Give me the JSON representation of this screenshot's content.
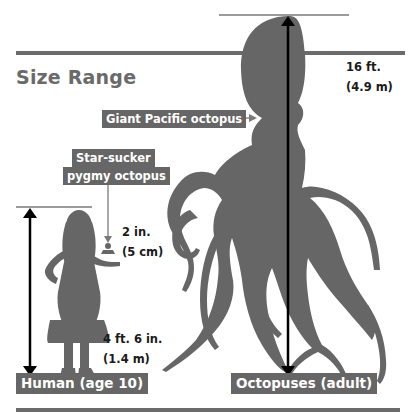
{
  "title": "Size Range",
  "colors": {
    "silhouette": "#666666",
    "label_bg": "#666666",
    "label_text": "#ffffff",
    "rule": "#6b6b6b",
    "arrow": "#000000",
    "measure_text": "#1a1a1a",
    "title_text": "#6a6a6a"
  },
  "labels": {
    "giant_pacific": "Giant Pacific octopus",
    "star_sucker_line1": "Star-sucker",
    "star_sucker_line2": "pygmy octopus",
    "human": "Human (age 10)",
    "octopuses": "Octopuses (adult)"
  },
  "measurements": {
    "octopus_ft": "16 ft.",
    "octopus_m": "(4.9 m)",
    "pygmy_in": "2 in.",
    "pygmy_cm": "(5 cm)",
    "human_ft": "4 ft. 6 in.",
    "human_m": "(1.4 m)"
  },
  "icons": {
    "octopus": "octopus-silhouette",
    "human": "girl-silhouette",
    "pygmy": "tiny-octopus-silhouette"
  }
}
